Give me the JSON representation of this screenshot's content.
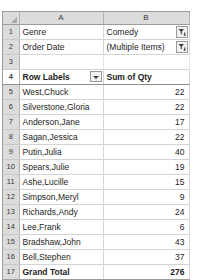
{
  "artifact": {
    "top_sliver_text": "..."
  },
  "spreadsheet": {
    "column_headers": [
      "A",
      "B"
    ],
    "row_numbers": [
      "1",
      "2",
      "3",
      "4",
      "5",
      "6",
      "7",
      "8",
      "9",
      "10",
      "11",
      "12",
      "13",
      "14",
      "15",
      "16",
      "17"
    ],
    "page_fields": [
      {
        "label": "Genre",
        "value": "Comedy",
        "filter_icon": "filter-funnel-icon"
      },
      {
        "label": "Order Date",
        "value": "(Multiple Items)",
        "filter_icon": "filter-funnel-icon"
      }
    ],
    "pivot_header": {
      "row_labels": "Row Labels",
      "value_header": "Sum of Qty",
      "sort_icon": "chevron-down-icon"
    },
    "rows": [
      {
        "label": "West,Chuck",
        "qty": "22"
      },
      {
        "label": "Silverstone,Gloria",
        "qty": "22"
      },
      {
        "label": "Anderson,Jane",
        "qty": "17"
      },
      {
        "label": "Sagan,Jessica",
        "qty": "22"
      },
      {
        "label": "Putin,Julia",
        "qty": "40"
      },
      {
        "label": "Spears,Julie",
        "qty": "19"
      },
      {
        "label": "Ashe,Lucille",
        "qty": "15"
      },
      {
        "label": "Simpson,Meryl",
        "qty": "9"
      },
      {
        "label": "Richards,Andy",
        "qty": "24"
      },
      {
        "label": "Lee,Frank",
        "qty": "6"
      },
      {
        "label": "Bradshaw,John",
        "qty": "43"
      },
      {
        "label": "Bell,Stephen",
        "qty": "37"
      }
    ],
    "grand_total": {
      "label": "Grand Total",
      "qty": "276"
    }
  },
  "colors": {
    "header_band": "#dcdcdc",
    "grid_line": "#d4d4d4",
    "outer_border": "#9c9c9c",
    "text": "#1d1d1d"
  }
}
